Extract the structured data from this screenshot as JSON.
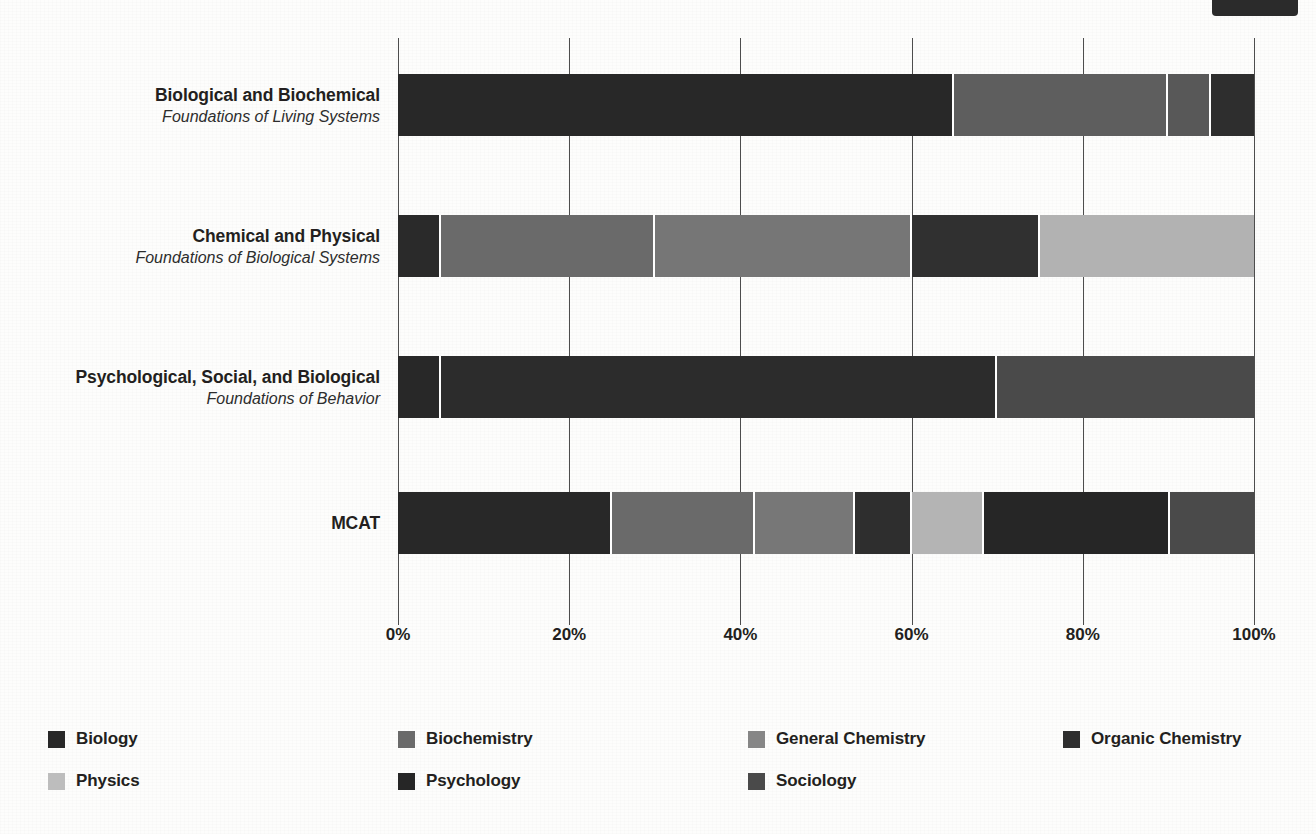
{
  "chart_data": {
    "type": "bar",
    "orientation": "horizontal",
    "stacked": true,
    "normalized": true,
    "title": "",
    "xlabel": "",
    "ylabel": "",
    "xlim": [
      0,
      100
    ],
    "grid": true,
    "legend_position": "bottom",
    "xticks": [
      "0%",
      "20%",
      "40%",
      "60%",
      "80%",
      "100%"
    ],
    "xtick_values": [
      0,
      20,
      40,
      60,
      80,
      100
    ],
    "categories": [
      {
        "main": "Biological and Biochemical",
        "sub": "Foundations of Living Systems"
      },
      {
        "main": "Chemical and Physical",
        "sub": "Foundations of Biological Systems"
      },
      {
        "main": "Psychological, Social, and Biological",
        "sub": "Foundations of Behavior"
      },
      {
        "main": "MCAT",
        "sub": ""
      }
    ],
    "series": [
      {
        "name": "Biology",
        "color": "#282828",
        "values": [
          65,
          0,
          5,
          25
        ]
      },
      {
        "name": "Biochemistry",
        "color": "#5e5e5e",
        "values": [
          25,
          5,
          0,
          16.7
        ]
      },
      {
        "name": "General Chemistry",
        "color": "#7d7d7d",
        "values": [
          0,
          25,
          0,
          11.7
        ]
      },
      {
        "name": "Organic Chemistry",
        "color": "#2e2e2e",
        "values": [
          5,
          0,
          0,
          6.6
        ]
      },
      {
        "name": "Physics",
        "color": "#b4b4b4",
        "values": [
          0,
          0,
          0,
          8.5
        ]
      },
      {
        "name": "Psychology",
        "color": "#262626",
        "values": [
          0,
          0,
          65,
          21.7
        ]
      },
      {
        "name": "Sociology",
        "color": "#4a4a4a",
        "values": [
          5,
          0,
          30,
          9.8
        ]
      }
    ],
    "rows": [
      {
        "category": "Biological and Biochemical",
        "segments": [
          {
            "series": "Biology",
            "value": 65,
            "color": "#282828"
          },
          {
            "series": "Biochemistry",
            "value": 25,
            "color": "#5e5e5e"
          },
          {
            "series": "Sociology",
            "value": 5,
            "color": "#585858"
          },
          {
            "series": "Organic Chemistry",
            "value": 5,
            "color": "#2e2e2e"
          }
        ]
      },
      {
        "category": "Chemical and Physical",
        "segments": [
          {
            "series": "Biology",
            "value": 5,
            "color": "#2a2a2a"
          },
          {
            "series": "Biochemistry",
            "value": 25,
            "color": "#6a6a6a"
          },
          {
            "series": "General Chemistry",
            "value": 30,
            "color": "#767676"
          },
          {
            "series": "Organic Chemistry",
            "value": 15,
            "color": "#303030"
          },
          {
            "series": "Physics",
            "value": 25,
            "color": "#b2b2b2"
          }
        ]
      },
      {
        "category": "Psychological, Social, and Biological",
        "segments": [
          {
            "series": "Biology",
            "value": 5,
            "color": "#282828"
          },
          {
            "series": "Psychology",
            "value": 65,
            "color": "#2c2c2c"
          },
          {
            "series": "Sociology",
            "value": 30,
            "color": "#4a4a4a"
          }
        ]
      },
      {
        "category": "MCAT",
        "segments": [
          {
            "series": "Biology",
            "value": 25,
            "color": "#282828"
          },
          {
            "series": "Biochemistry",
            "value": 16.7,
            "color": "#6a6a6a"
          },
          {
            "series": "General Chemistry",
            "value": 11.7,
            "color": "#777777"
          },
          {
            "series": "Organic Chemistry",
            "value": 6.6,
            "color": "#2e2e2e"
          },
          {
            "series": "Physics",
            "value": 8.5,
            "color": "#b4b4b4"
          },
          {
            "series": "Psychology",
            "value": 21.7,
            "color": "#262626"
          },
          {
            "series": "Sociology",
            "value": 9.8,
            "color": "#4a4a4a"
          }
        ]
      }
    ]
  },
  "legend": {
    "items": [
      {
        "label": "Biology",
        "color": "#282828"
      },
      {
        "label": "Biochemistry",
        "color": "#6a6a6a"
      },
      {
        "label": "General Chemistry",
        "color": "#868686"
      },
      {
        "label": "Organic Chemistry",
        "color": "#2e2e2e"
      },
      {
        "label": "Physics",
        "color": "#bdbdbd"
      },
      {
        "label": "Psychology",
        "color": "#262626"
      },
      {
        "label": "Sociology",
        "color": "#4a4a4a"
      }
    ]
  }
}
